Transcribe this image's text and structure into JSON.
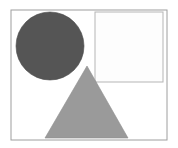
{
  "canvas": {
    "width": 178,
    "height": 148,
    "background_color": "#ffffff"
  },
  "figure": {
    "frame": {
      "name": "outer-frame",
      "x": 11,
      "y": 10,
      "width": 156,
      "height": 130,
      "fill_color": "#ffffff",
      "stroke_color": "#9e9e9e",
      "stroke_width": 1
    },
    "shapes": [
      {
        "name": "dark-circle",
        "type": "circle",
        "cx": 50,
        "cy": 46,
        "r": 34,
        "fill_color": "#555555",
        "stroke_color": "#4a4a4a",
        "stroke_width": 0.6,
        "label": "Circle"
      },
      {
        "name": "white-square",
        "type": "rect",
        "x": 95,
        "y": 12,
        "width": 68,
        "height": 70,
        "fill_color": "#fdfdfd",
        "stroke_color": "#b5b5b5",
        "stroke_width": 1,
        "label": "Square"
      },
      {
        "name": "gray-triangle",
        "type": "triangle",
        "points": "87,66 128,138 45,138",
        "apex_x": 87,
        "apex_y": 66,
        "base_left_x": 45,
        "base_right_x": 128,
        "base_y": 138,
        "fill_color": "#9a9a9a",
        "stroke_color": "#8f8f8f",
        "stroke_width": 0.6,
        "label": "Triangle"
      }
    ]
  }
}
